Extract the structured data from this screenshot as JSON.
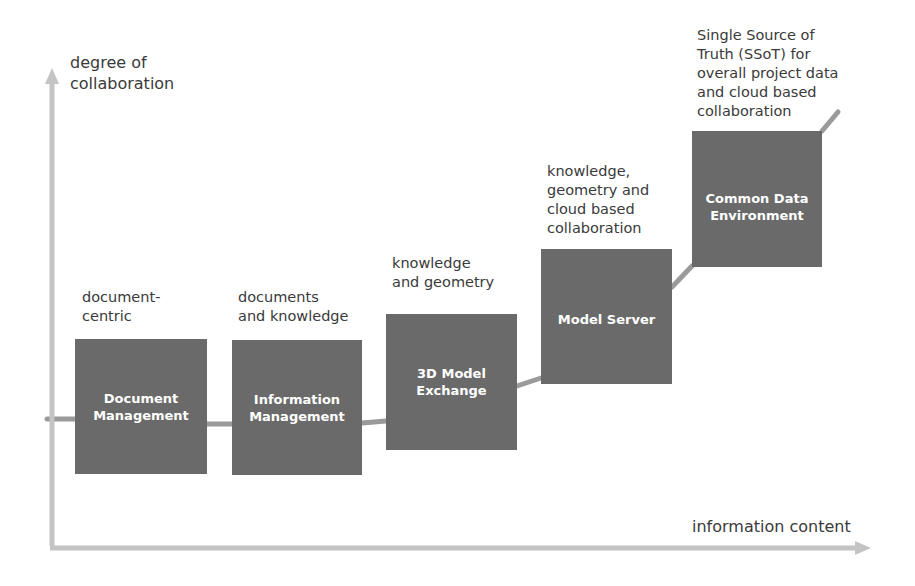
{
  "axes": {
    "y_label": "degree of\ncollaboration",
    "x_label": "information content",
    "color": "#c4c4c4"
  },
  "stages": [
    {
      "title": "Document\nManagement",
      "description": "document-\ncentric"
    },
    {
      "title": "Information\nManagement",
      "description": "documents\nand knowledge"
    },
    {
      "title": "3D Model\nExchange",
      "description": "knowledge\nand geometry"
    },
    {
      "title": "Model Server",
      "description": "knowledge,\ngeometry and\ncloud based\ncollaboration"
    },
    {
      "title": "Common Data\nEnvironment",
      "description": "Single Source of\nTruth (SSoT) for\noverall project data\nand cloud based\ncollaboration"
    }
  ],
  "colors": {
    "box_fill": "#6a6a6a",
    "box_text": "#ffffff",
    "connector": "#9a9a9a",
    "axis": "#c4c4c4"
  }
}
